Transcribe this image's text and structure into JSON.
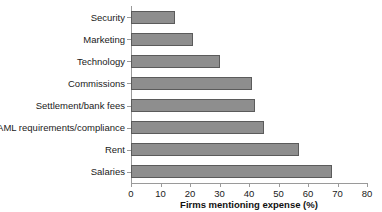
{
  "chart_data": {
    "type": "bar",
    "orientation": "horizontal",
    "title": "",
    "xlabel": "Firms mentioning expense (%)",
    "ylabel": "",
    "xlim": [
      0,
      80
    ],
    "xticks": [
      0,
      10,
      20,
      30,
      40,
      50,
      60,
      70,
      80
    ],
    "grid": false,
    "legend": null,
    "categories": [
      "Security",
      "Marketing",
      "Technology",
      "Commissions",
      "Settlement/bank fees",
      "AML requirements/compliance",
      "Rent",
      "Salaries"
    ],
    "values": [
      15,
      21,
      30,
      41,
      42,
      45,
      57,
      68
    ],
    "bar_color": "#8e8e8e",
    "bar_edge_color": "#5b5b5b",
    "axis_color": "#9a9a9a"
  }
}
